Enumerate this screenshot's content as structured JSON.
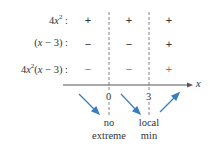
{
  "rows": [
    {
      "label": "4x²:",
      "signs": [
        "+",
        "+",
        "+"
      ],
      "color": "#333333"
    },
    {
      "label": "(x − 3):",
      "signs": [
        "−",
        "−",
        "+"
      ],
      "color": "#333333"
    },
    {
      "label": "4x²(x − 3):",
      "signs": [
        "−",
        "−",
        "+"
      ],
      "color": "#d9534f"
    }
  ],
  "axis": {
    "label": "x",
    "ticks": [
      "0",
      "3"
    ]
  },
  "annotations": {
    "at_0": [
      "no",
      "extreme"
    ],
    "at_3": [
      "local",
      "min"
    ]
  },
  "arrows": [
    "decreasing",
    "decreasing",
    "increasing"
  ],
  "colors": {
    "arrow": "#3a7cc0",
    "negative_result": "#d9534f",
    "line": "#555555"
  }
}
